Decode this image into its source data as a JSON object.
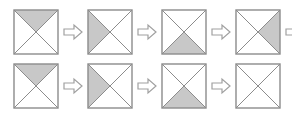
{
  "figure": {
    "type": "visual-analogy-sequence",
    "background_color": "#ffffff",
    "square_border_color": "#8c8c8c",
    "diagonal_color": "#8c8c8c",
    "shade_fill_color": "#c8c8c8",
    "arrow_outline_color": "#a0a0a0",
    "arrow_fill_color": "#ffffff",
    "arrow_icon_name": "right-arrow-icon",
    "square_size_px": 46,
    "arrow_size_px": 22
  },
  "rows": [
    {
      "name": "top-row",
      "trailing_arrow": true,
      "cells": [
        {
          "label": "square-1",
          "shaded": "top",
          "empty": false
        },
        {
          "label": "square-2",
          "shaded": "left",
          "empty": false
        },
        {
          "label": "square-3",
          "shaded": "bottom",
          "empty": false
        },
        {
          "label": "square-4",
          "shaded": "right",
          "empty": false
        }
      ]
    },
    {
      "name": "bottom-row",
      "trailing_arrow": false,
      "cells": [
        {
          "label": "square-5",
          "shaded": "top",
          "empty": false
        },
        {
          "label": "square-6",
          "shaded": "left",
          "empty": false
        },
        {
          "label": "square-7",
          "shaded": "bottom",
          "empty": false
        },
        {
          "label": "square-8",
          "shaded": "none",
          "empty": true
        }
      ]
    }
  ]
}
